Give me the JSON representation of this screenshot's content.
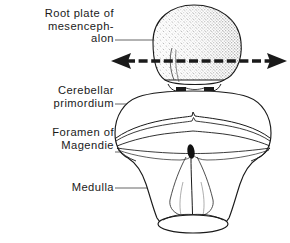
{
  "figure": {
    "background_color": "#ffffff",
    "ink_color": "#1a1a1a",
    "width": 290,
    "height": 243
  },
  "labels": {
    "root_plate": "Root plate of\nmesenceph-\nalon",
    "cerebellar": "Cerebellar\nprimordium",
    "foramen": "Foramen of\nMagendie",
    "medulla": "Medulla"
  },
  "structures": {
    "mesencephalon_roof_plate": {
      "name": "Root plate of mesencephalon",
      "shape": "stippled sphere",
      "shading": "stipple gradient, light upper-left to dark lower-right"
    },
    "cerebellar_primordium": {
      "name": "Cerebellar primordium",
      "shape": "broad arched transverse band"
    },
    "foramen_of_magendie": {
      "name": "Foramen of Magendie",
      "shape": "small solid black oval",
      "fill": "#111111"
    },
    "medulla": {
      "name": "Medulla",
      "shape": "flaring funnel with elliptical caudal rim"
    }
  },
  "annotations": {
    "expansion_arrow": {
      "name": "bidirectional expansion arrow",
      "direction": "horizontal double-headed",
      "style": "dashed shaft with solid arrowheads"
    }
  },
  "leader_lines": [
    {
      "for": "root_plate",
      "from_x": 115,
      "from_y": 40,
      "to_x": 197,
      "to_y": 40
    },
    {
      "for": "cerebellar",
      "from_x": 115,
      "from_y": 104,
      "to_x": 151,
      "to_y": 104
    },
    {
      "for": "foramen",
      "from_x": 115,
      "from_y": 152,
      "to_x": 190,
      "to_y": 152
    },
    {
      "for": "medulla",
      "from_x": 115,
      "from_y": 188,
      "to_x": 169,
      "to_y": 188
    }
  ]
}
